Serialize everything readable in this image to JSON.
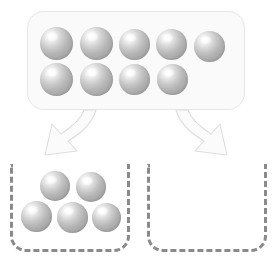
{
  "diagram": {
    "type": "counter-partition",
    "colors": {
      "sphere_highlight": "#ffffff",
      "sphere_mid": "#c6c6c6",
      "sphere_shadow": "#9a9a9a",
      "tray_fill": "#fafafa",
      "tray_border": "#e6e6e6",
      "bin_border": "#8a8a8a",
      "arrow_fill": "#fbfbfb",
      "arrow_stroke": "#dedede",
      "background": "#ffffff"
    }
  },
  "source_tray": {
    "label": "Source tray of counters",
    "total_count": 9,
    "rows": [
      {
        "row_label": "top-row",
        "count": 5,
        "spheres": [
          {
            "name": "sphere-1",
            "x": 40,
            "y": 27,
            "size": 33
          },
          {
            "name": "sphere-2",
            "x": 80,
            "y": 27,
            "size": 33
          },
          {
            "name": "sphere-3",
            "x": 119,
            "y": 29,
            "size": 31
          },
          {
            "name": "sphere-4",
            "x": 156,
            "y": 29,
            "size": 31
          },
          {
            "name": "sphere-5",
            "x": 194,
            "y": 31,
            "size": 31
          }
        ]
      },
      {
        "row_label": "bottom-row",
        "count": 4,
        "spheres": [
          {
            "name": "sphere-6",
            "x": 40,
            "y": 63,
            "size": 33
          },
          {
            "name": "sphere-7",
            "x": 80,
            "y": 63,
            "size": 33
          },
          {
            "name": "sphere-8",
            "x": 119,
            "y": 64,
            "size": 31
          },
          {
            "name": "sphere-9",
            "x": 157,
            "y": 64,
            "size": 31
          }
        ]
      }
    ]
  },
  "arrows": [
    {
      "name": "arrow-to-left-bin",
      "direction": "down-left",
      "path": "M 96 110 C 92 124, 80 134, 68 141 L 77 151 L 45 155 L 52 124 L 61 134 C 72 127, 81 119, 84 110 Z"
    },
    {
      "name": "arrow-to-right-bin",
      "direction": "down-right",
      "path": "M 176 110 C 180 124, 192 134, 204 141 L 195 151 L 227 155 L 220 124 L 211 134 C 200 127, 191 119, 188 110 Z"
    }
  ],
  "bins": [
    {
      "name": "left-bin",
      "label": "Left group",
      "count": 5,
      "empty": false,
      "rows": [
        {
          "row_label": "top-row",
          "count": 2,
          "spheres": [
            {
              "name": "bin-left-sphere-1",
              "x": 40,
              "y": 171,
              "size": 30
            },
            {
              "name": "bin-left-sphere-2",
              "x": 76,
              "y": 172,
              "size": 30
            }
          ]
        },
        {
          "row_label": "bottom-row",
          "count": 3,
          "spheres": [
            {
              "name": "bin-left-sphere-3",
              "x": 21,
              "y": 201,
              "size": 31
            },
            {
              "name": "bin-left-sphere-4",
              "x": 57,
              "y": 202,
              "size": 31
            },
            {
              "name": "bin-left-sphere-5",
              "x": 92,
              "y": 203,
              "size": 29
            }
          ]
        }
      ]
    },
    {
      "name": "right-bin",
      "label": "Right group",
      "count": 0,
      "empty": true,
      "rows": []
    }
  ]
}
